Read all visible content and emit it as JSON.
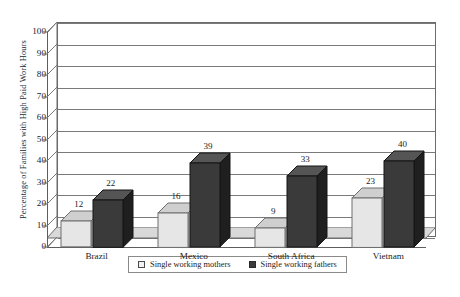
{
  "chart_data": {
    "type": "bar",
    "title": "",
    "xlabel": "",
    "ylabel": "Percentage of Families with High Paid Work Hours",
    "categories": [
      "Brazil",
      "Mexico",
      "South Africa",
      "Vietnam"
    ],
    "series": [
      {
        "name": "Single working mothers",
        "values": [
          12,
          16,
          9,
          23
        ],
        "color": "#e6e6e6"
      },
      {
        "name": "Single working fathers",
        "values": [
          22,
          39,
          33,
          40
        ],
        "color": "#3a3a3a"
      }
    ],
    "ylim": [
      0,
      100
    ],
    "y_ticks": [
      0,
      10,
      20,
      30,
      40,
      50,
      60,
      70,
      80,
      90,
      100
    ],
    "y_tick_labels": [
      "0",
      "10",
      "20",
      "30",
      "40",
      "50",
      "60",
      "70",
      "80",
      "90",
      "100"
    ],
    "grid": true,
    "legend_position": "bottom",
    "style": "3d-column",
    "data_labels": true
  },
  "legend": {
    "items": [
      {
        "label": "Single working mothers",
        "swatch": "light-gray-square"
      },
      {
        "label": "Single working fathers",
        "swatch": "dark-gray-square"
      }
    ]
  },
  "colors": {
    "background": "#ffffff",
    "axis": "#5d5d5d",
    "gridline": "#7a7a7a",
    "wall_border": "#6b6b6b",
    "floor": "#d9d9d9",
    "bar_light_front": "#e6e6e6",
    "bar_light_top": "#cfcfcf",
    "bar_light_side": "#bdbdbd",
    "bar_dark_front": "#3a3a3a",
    "bar_dark_top": "#555555",
    "bar_dark_side": "#1f1f1f",
    "text": "#1c1c1c"
  }
}
